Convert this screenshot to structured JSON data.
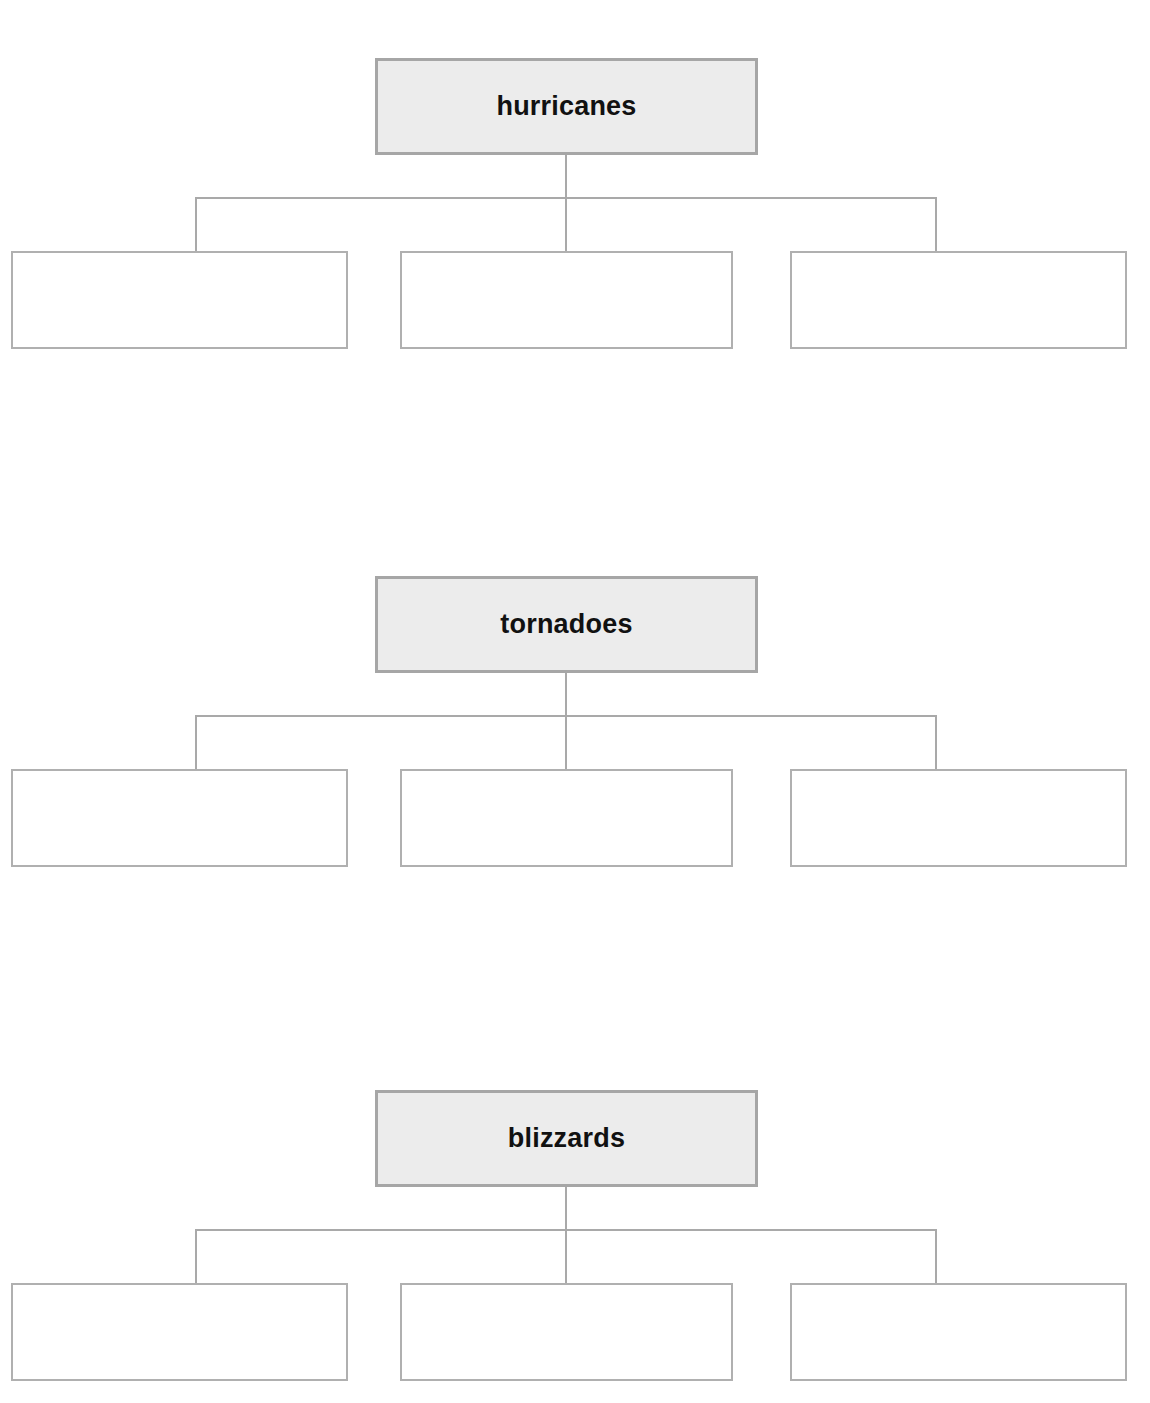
{
  "page": {
    "background_color": "#ffffff",
    "width": 1150,
    "height": 1403
  },
  "style": {
    "topic_fill": "#ececec",
    "topic_border": "#a6a6a6",
    "answer_fill": "#ffffff",
    "answer_border": "#b0b0b0",
    "connector_color": "#a9a9a9",
    "label_color": "#111111"
  },
  "organizers": [
    {
      "id": "hurricanes",
      "top": 58,
      "topic": {
        "label": "hurricanes"
      },
      "children": [
        {
          "id": "hurricanes-detail-1",
          "label": "",
          "placeholder": ""
        },
        {
          "id": "hurricanes-detail-2",
          "label": "",
          "placeholder": ""
        },
        {
          "id": "hurricanes-detail-3",
          "label": "",
          "placeholder": ""
        }
      ]
    },
    {
      "id": "tornadoes",
      "top": 576,
      "topic": {
        "label": "tornadoes"
      },
      "children": [
        {
          "id": "tornadoes-detail-1",
          "label": "",
          "placeholder": ""
        },
        {
          "id": "tornadoes-detail-2",
          "label": "",
          "placeholder": ""
        },
        {
          "id": "tornadoes-detail-3",
          "label": "",
          "placeholder": ""
        }
      ]
    },
    {
      "id": "blizzards",
      "top": 1090,
      "topic": {
        "label": "blizzards"
      },
      "children": [
        {
          "id": "blizzards-detail-1",
          "label": "",
          "placeholder": ""
        },
        {
          "id": "blizzards-detail-2",
          "label": "",
          "placeholder": ""
        },
        {
          "id": "blizzards-detail-3",
          "label": "",
          "placeholder": ""
        }
      ]
    }
  ]
}
